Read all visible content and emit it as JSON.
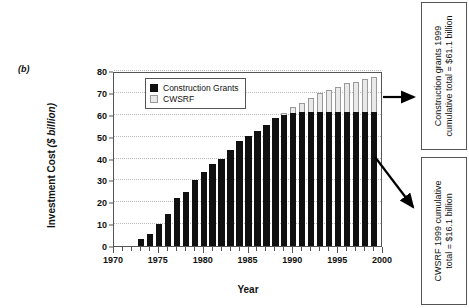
{
  "panel": {
    "label": "(b)"
  },
  "legend": {
    "items": [
      {
        "label": "Construction Grants",
        "color": "#101010",
        "swatch": "dark"
      },
      {
        "label": "CWSRF",
        "color": "#e9e9e9",
        "swatch": "light"
      }
    ]
  },
  "callouts": [
    {
      "name": "construction-grants-callout",
      "line1": "Construction grants 1999",
      "line2": "cumulative total = $61.1 billion"
    },
    {
      "name": "cwsrf-callout",
      "line1": "CWSRF 1999 cumulative",
      "line2": "total = $16.1 billion"
    }
  ],
  "chart_data": {
    "type": "bar",
    "stacked": true,
    "title": "",
    "xlabel": "Year",
    "ylabel": "Investment Cost ($ billion)",
    "ylabel_plain": "Investment Cost",
    "ylabel_italic": "($ billion)",
    "xlim": [
      1970,
      2000
    ],
    "ylim": [
      0,
      80
    ],
    "yticks": [
      0,
      10,
      20,
      30,
      40,
      50,
      60,
      70,
      80
    ],
    "xticks_major": [
      1970,
      1975,
      1980,
      1985,
      1990,
      1995,
      2000
    ],
    "xtick_step_minor": 1,
    "grid": true,
    "legend_position": "upper-left-inside",
    "categories": [
      1973,
      1974,
      1975,
      1976,
      1977,
      1978,
      1979,
      1980,
      1981,
      1982,
      1983,
      1984,
      1985,
      1986,
      1987,
      1988,
      1989,
      1990,
      1991,
      1992,
      1993,
      1994,
      1995,
      1996,
      1997,
      1998,
      1999
    ],
    "series": [
      {
        "name": "Construction Grants",
        "color": "#101010",
        "values": [
          3.1,
          5.7,
          10.1,
          14.7,
          21.9,
          24.8,
          30.1,
          33.9,
          37.5,
          39.6,
          43.7,
          48.1,
          50.4,
          52.7,
          55.2,
          58.4,
          60.0,
          60.8,
          61.1,
          61.1,
          61.1,
          61.1,
          61.1,
          61.1,
          61.1,
          61.1,
          61.1
        ]
      },
      {
        "name": "CWSRF",
        "color": "#e9e9e9",
        "values": [
          0,
          0,
          0,
          0,
          0,
          0,
          0,
          0,
          0,
          0,
          0,
          0,
          0,
          0,
          0,
          0,
          1.0,
          2.7,
          4.5,
          6.6,
          8.8,
          10.2,
          11.7,
          13.2,
          14.1,
          15.2,
          16.1
        ]
      }
    ],
    "totals_1999": {
      "construction_grants": 61.1,
      "cwsrf": 16.1,
      "combined": 77.2
    }
  }
}
